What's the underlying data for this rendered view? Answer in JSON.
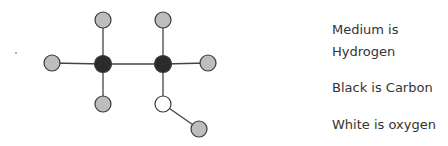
{
  "diagram": {
    "colors": {
      "hydrogen": "#bdbdbd",
      "carbon": "#2b2b2b",
      "oxygen": "#ffffff",
      "stroke": "#3a3a3a",
      "bond": "#444444"
    },
    "atoms": [
      {
        "id": "H1",
        "element": "hydrogen",
        "x": 103,
        "y": 20
      },
      {
        "id": "H2",
        "element": "hydrogen",
        "x": 163,
        "y": 20
      },
      {
        "id": "H3",
        "element": "hydrogen",
        "x": 52,
        "y": 63
      },
      {
        "id": "C1",
        "element": "carbon",
        "x": 103,
        "y": 64
      },
      {
        "id": "C2",
        "element": "carbon",
        "x": 163,
        "y": 64
      },
      {
        "id": "H4",
        "element": "hydrogen",
        "x": 208,
        "y": 63
      },
      {
        "id": "H5",
        "element": "hydrogen",
        "x": 103,
        "y": 104
      },
      {
        "id": "O1",
        "element": "oxygen",
        "x": 163,
        "y": 104
      },
      {
        "id": "H6",
        "element": "hydrogen",
        "x": 199,
        "y": 129
      }
    ],
    "bonds": [
      [
        "C1",
        "H1"
      ],
      [
        "C1",
        "H3"
      ],
      [
        "C1",
        "H5"
      ],
      [
        "C1",
        "C2"
      ],
      [
        "C2",
        "H2"
      ],
      [
        "C2",
        "H4"
      ],
      [
        "C2",
        "O1"
      ],
      [
        "O1",
        "H6"
      ]
    ]
  },
  "legend": {
    "lines": [
      {
        "text": "Medium is",
        "y": 30
      },
      {
        "text": "Hydrogen",
        "y": 52
      },
      {
        "text": "Black is Carbon",
        "y": 88
      },
      {
        "text": "White is oxygen",
        "y": 125
      }
    ]
  }
}
